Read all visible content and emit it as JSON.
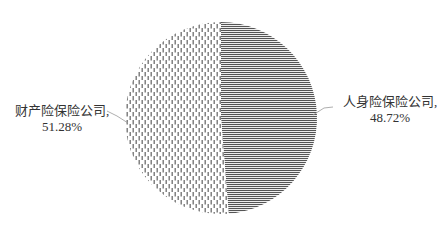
{
  "chart_data": {
    "type": "pie",
    "title": "",
    "start_angle_deg": 0,
    "direction": "clockwise",
    "legend": "none",
    "slices": [
      {
        "name": "人身险保险公司",
        "value": 48.72,
        "label_line1": "人身险保险公司,",
        "label_line2": "48.72%",
        "pattern": "horizontal-lines",
        "color": "#555555"
      },
      {
        "name": "财产险保险公司",
        "value": 51.28,
        "label_line1": "财产险保险公司,",
        "label_line2": "51.28%",
        "pattern": "vertical-dashes",
        "color": "#777777"
      }
    ]
  },
  "colors": {
    "background": "#ffffff",
    "text": "#333333",
    "leader_line": "#999999"
  }
}
